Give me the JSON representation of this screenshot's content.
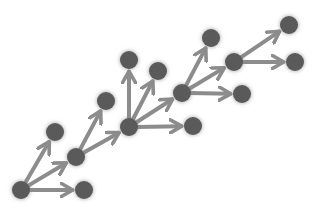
{
  "caption": "",
  "colors": {
    "node": "#5a5a5a",
    "glow": "#9a9a9a",
    "edge": "#8c8c8c",
    "background": "#ffffff"
  },
  "node_radius": 9,
  "nodes": [
    {
      "id": "A",
      "x": 21,
      "y": 190
    },
    {
      "id": "B",
      "x": 84,
      "y": 190
    },
    {
      "id": "C",
      "x": 55,
      "y": 132
    },
    {
      "id": "D",
      "x": 76,
      "y": 157
    },
    {
      "id": "E",
      "x": 106,
      "y": 101
    },
    {
      "id": "F",
      "x": 129,
      "y": 127
    },
    {
      "id": "G",
      "x": 129,
      "y": 60
    },
    {
      "id": "H",
      "x": 158,
      "y": 71
    },
    {
      "id": "I",
      "x": 193,
      "y": 126
    },
    {
      "id": "J",
      "x": 182,
      "y": 93
    },
    {
      "id": "K",
      "x": 211,
      "y": 38
    },
    {
      "id": "L",
      "x": 234,
      "y": 62
    },
    {
      "id": "M",
      "x": 242,
      "y": 94
    },
    {
      "id": "N",
      "x": 289,
      "y": 25
    },
    {
      "id": "O",
      "x": 295,
      "y": 62
    }
  ],
  "edges": [
    {
      "from": "A",
      "to": "B"
    },
    {
      "from": "A",
      "to": "C"
    },
    {
      "from": "A",
      "to": "D"
    },
    {
      "from": "D",
      "to": "E"
    },
    {
      "from": "D",
      "to": "F"
    },
    {
      "from": "F",
      "to": "G"
    },
    {
      "from": "F",
      "to": "H"
    },
    {
      "from": "F",
      "to": "I"
    },
    {
      "from": "F",
      "to": "J"
    },
    {
      "from": "J",
      "to": "K"
    },
    {
      "from": "J",
      "to": "L"
    },
    {
      "from": "J",
      "to": "M"
    },
    {
      "from": "L",
      "to": "N"
    },
    {
      "from": "L",
      "to": "O"
    }
  ]
}
